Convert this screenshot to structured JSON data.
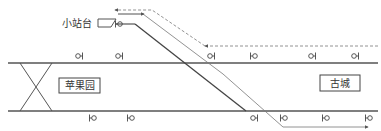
{
  "diagram": {
    "type": "railway-track-layout",
    "colors": {
      "track": "#555555",
      "route_line": "#666666",
      "text": "#333333",
      "background": "#ffffff"
    },
    "labels": {
      "siding": "小站台",
      "station_left": "苹果园",
      "station_right": "古城"
    },
    "tracks": {
      "upper_main": {
        "y": 63,
        "x1": 8,
        "x2": 378
      },
      "lower_main": {
        "y": 111,
        "x1": 8,
        "x2": 378
      }
    },
    "signals": {
      "upper": [
        {
          "x": 80,
          "glyph": "OI"
        },
        {
          "x": 120,
          "glyph": "OI"
        },
        {
          "x": 212,
          "glyph": "OI"
        },
        {
          "x": 253,
          "glyph": "IO"
        },
        {
          "x": 313,
          "glyph": "OI"
        },
        {
          "x": 356,
          "glyph": "OI"
        }
      ],
      "lower": [
        {
          "x": 92,
          "glyph": "IO"
        },
        {
          "x": 130,
          "glyph": "IO"
        },
        {
          "x": 255,
          "glyph": "OI"
        },
        {
          "x": 283,
          "glyph": "IO"
        },
        {
          "x": 325,
          "glyph": "IO"
        },
        {
          "x": 368,
          "glyph": "IO"
        }
      ],
      "siding": [
        {
          "x": 118,
          "glyph": "IO"
        }
      ]
    }
  }
}
